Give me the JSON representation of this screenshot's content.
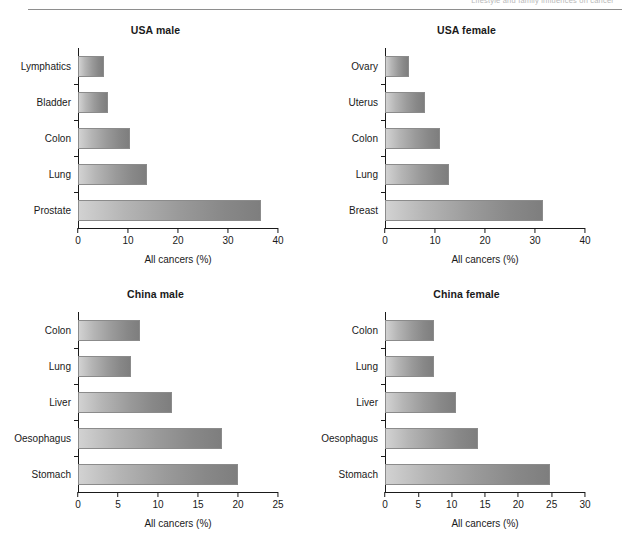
{
  "header": {
    "running_head": "Lifestyle and family influences on cancer"
  },
  "figure": {
    "x_axis_title": "All cancers (%)"
  },
  "chart_data": [
    {
      "type": "bar",
      "orientation": "horizontal",
      "title": "USA male",
      "categories": [
        "Lymphatics",
        "Bladder",
        "Colon",
        "Lung",
        "Prostate"
      ],
      "values": [
        5.2,
        6.0,
        10.3,
        13.8,
        36.5
      ],
      "xlabel": "All cancers (%)",
      "ylabel": "",
      "xlim": [
        0,
        40
      ],
      "xticks": [
        0,
        10,
        20,
        30,
        40
      ],
      "grid": false,
      "legend": "none"
    },
    {
      "type": "bar",
      "orientation": "horizontal",
      "title": "USA female",
      "categories": [
        "Ovary",
        "Uterus",
        "Colon",
        "Lung",
        "Breast"
      ],
      "values": [
        4.8,
        8.0,
        11.0,
        12.7,
        31.5
      ],
      "xlabel": "All cancers (%)",
      "ylabel": "",
      "xlim": [
        0,
        40
      ],
      "xticks": [
        0,
        10,
        20,
        30,
        40
      ],
      "grid": false,
      "legend": "none"
    },
    {
      "type": "bar",
      "orientation": "horizontal",
      "title": "China male",
      "categories": [
        "Colon",
        "Lung",
        "Liver",
        "Oesophagus",
        "Stomach"
      ],
      "values": [
        7.7,
        6.6,
        11.8,
        18.0,
        20.0
      ],
      "xlabel": "All cancers (%)",
      "ylabel": "",
      "xlim": [
        0,
        25
      ],
      "xticks": [
        0,
        5,
        10,
        15,
        20,
        25
      ],
      "grid": false,
      "legend": "none"
    },
    {
      "type": "bar",
      "orientation": "horizontal",
      "title": "China female",
      "categories": [
        "Colon",
        "Lung",
        "Liver",
        "Oesophagus",
        "Stomach"
      ],
      "values": [
        7.3,
        7.3,
        10.6,
        14.0,
        24.8
      ],
      "xlabel": "All cancers (%)",
      "ylabel": "",
      "xlim": [
        0,
        30
      ],
      "xticks": [
        0,
        5,
        10,
        15,
        20,
        25,
        30
      ],
      "grid": false,
      "legend": "none"
    }
  ]
}
